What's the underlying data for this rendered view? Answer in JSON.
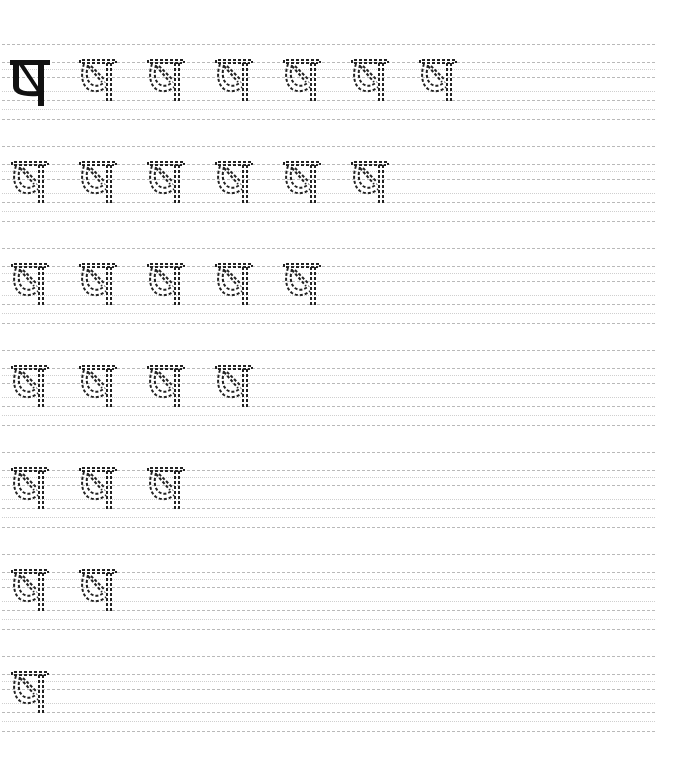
{
  "worksheet": {
    "letter": "ष",
    "model_glyph_label": "ष",
    "colors": {
      "background": "#ffffff",
      "guide_line": "#b9b9b9",
      "guide_dotted": "#cfcfcf",
      "trace_stroke": "#222222",
      "model_fill": "#111111"
    },
    "rows": [
      {
        "row": 1,
        "model": true,
        "trace_count": 6
      },
      {
        "row": 2,
        "model": false,
        "trace_count": 6
      },
      {
        "row": 3,
        "model": false,
        "trace_count": 5
      },
      {
        "row": 4,
        "model": false,
        "trace_count": 4
      },
      {
        "row": 5,
        "model": false,
        "trace_count": 3
      },
      {
        "row": 6,
        "model": false,
        "trace_count": 2
      },
      {
        "row": 7,
        "model": false,
        "trace_count": 1
      }
    ]
  }
}
